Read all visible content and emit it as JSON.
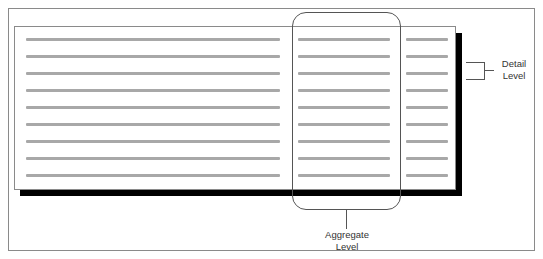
{
  "diagram": {
    "labels": {
      "detail": "Detail Level",
      "detail_line1": "Detail",
      "detail_line2": "Level",
      "aggregate_line1": "Aggregate",
      "aggregate_line2": "Level"
    },
    "rows": 9,
    "row_y": [
      39,
      56,
      73,
      90,
      107,
      124,
      141,
      158,
      175
    ],
    "columns": [
      {
        "name": "wide-column",
        "x": 26,
        "width": 254
      },
      {
        "name": "aggregate-column",
        "x": 298,
        "width": 92
      },
      {
        "name": "narrow-column",
        "x": 406,
        "width": 42
      }
    ],
    "colors": {
      "line": "#a8a8a8",
      "shadow": "#000000",
      "border": "#8a8a8a"
    }
  }
}
